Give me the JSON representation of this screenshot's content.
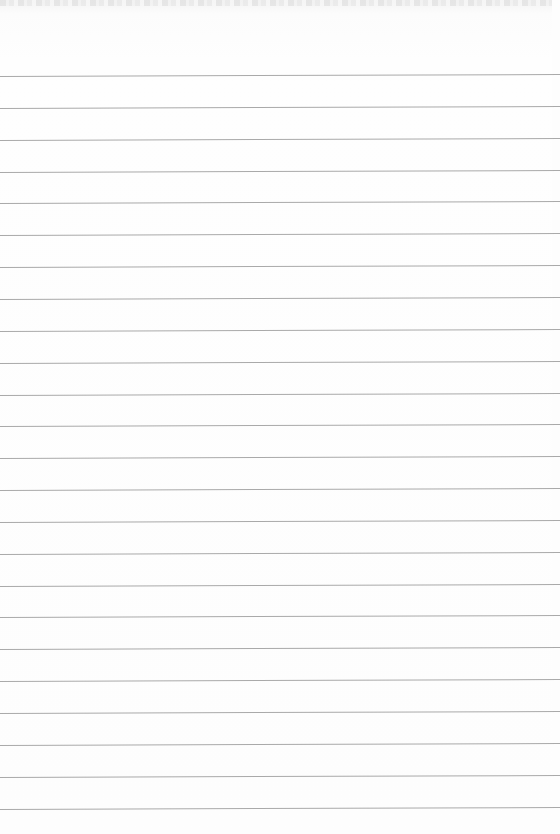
{
  "page": {
    "type": "blank lined paper",
    "line_color": "#a9a9a9",
    "background_color": "#fdfdfd",
    "line_count": 24,
    "first_line_y": 76,
    "line_spacing": 31.85
  }
}
